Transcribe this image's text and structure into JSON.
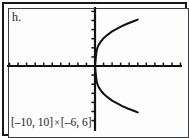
{
  "figure": {
    "part_label": "h.",
    "window_caption_full": "[–10, 10] × [–6, 6]",
    "caption_x_interval": "[–10, 10]",
    "caption_times": "×",
    "caption_y_interval": "[–6, 6]",
    "frame_color": "#17181a",
    "background_color": "#ffffff",
    "curve_color": "#111111",
    "axis_color": "#111111"
  },
  "chart_data": {
    "type": "line",
    "title": "h.",
    "xlabel": "",
    "ylabel": "",
    "xlim": [
      -10,
      10
    ],
    "ylim": [
      -6,
      6
    ],
    "grid": false,
    "legend": "none",
    "x_tick_step": 1,
    "y_tick_step": 1,
    "x_ticks": [
      -10,
      -9,
      -8,
      -7,
      -6,
      -5,
      -4,
      -3,
      -2,
      -1,
      0,
      1,
      2,
      3,
      4,
      5,
      6,
      7,
      8,
      9,
      10
    ],
    "y_ticks": [
      -6,
      -5,
      -4,
      -3,
      -2,
      -1,
      0,
      1,
      2,
      3,
      4,
      5,
      6
    ],
    "annotations": [
      "[–10, 10] × [–6, 6]"
    ],
    "series": [
      {
        "name": "upper branch",
        "points": [
          [
            0.0,
            0.0
          ],
          [
            0.05,
            0.45
          ],
          [
            0.1,
            0.95
          ],
          [
            0.15,
            1.35
          ],
          [
            0.2,
            1.7
          ],
          [
            0.3,
            2.05
          ],
          [
            0.45,
            2.35
          ],
          [
            0.7,
            2.7
          ],
          [
            1.0,
            3.05
          ],
          [
            1.5,
            3.45
          ],
          [
            2.0,
            3.8
          ],
          [
            2.6,
            4.1
          ],
          [
            3.2,
            4.4
          ],
          [
            3.9,
            4.7
          ],
          [
            4.6,
            4.95
          ],
          [
            5.0,
            5.1
          ]
        ]
      },
      {
        "name": "lower branch",
        "points": [
          [
            0.0,
            0.0
          ],
          [
            0.05,
            -0.45
          ],
          [
            0.1,
            -0.95
          ],
          [
            0.15,
            -1.35
          ],
          [
            0.2,
            -1.7
          ],
          [
            0.3,
            -2.05
          ],
          [
            0.45,
            -2.35
          ],
          [
            0.7,
            -2.7
          ],
          [
            1.0,
            -3.05
          ],
          [
            1.5,
            -3.45
          ],
          [
            2.0,
            -3.8
          ],
          [
            2.6,
            -4.1
          ],
          [
            3.2,
            -4.4
          ],
          [
            3.9,
            -4.7
          ],
          [
            4.6,
            -4.95
          ],
          [
            5.0,
            -5.1
          ]
        ]
      }
    ]
  }
}
